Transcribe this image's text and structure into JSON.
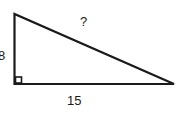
{
  "diagram": {
    "type": "right-triangle",
    "labels": {
      "vertical_leg": "8",
      "horizontal_leg": "15",
      "hypotenuse": "?"
    },
    "right_angle_marker": "bottom-left",
    "stroke_color": "#1a1a1a"
  }
}
